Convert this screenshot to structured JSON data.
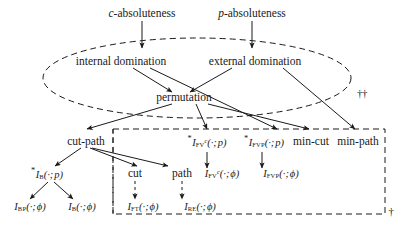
{
  "figure": {
    "type": "hierarchy-diagram",
    "background": "#ffffff",
    "stroke_color": "#1a1a1a"
  },
  "nodes": {
    "c_absoluteness": "c-absoluteness",
    "p_absoluteness": "p-absoluteness",
    "internal_domination": "internal domination",
    "external_domination": "external domination",
    "permutation": "permutation",
    "cut_path": "cut-path",
    "min_cut": "min-cut",
    "min_path": "min-path",
    "cut": "cut",
    "path": "path"
  },
  "math_nodes": {
    "i_fvc_p": {
      "star": "*",
      "sym": "I",
      "sub": "FV",
      "sup": "c",
      "arg": "(·; p)"
    },
    "i_fvp_p": {
      "star": "*",
      "sym": "I",
      "sub": "FVP",
      "sup": "",
      "arg": "(·; p)"
    },
    "i_fvc_phi": {
      "star": "",
      "sym": "I",
      "sub": "FV",
      "sup": "c",
      "arg": "(·; ϕ)"
    },
    "i_fvp_phi": {
      "star": "",
      "sym": "I",
      "sub": "FVP",
      "sup": "",
      "arg": "(·; ϕ)"
    },
    "i_b_p": {
      "star": "*",
      "sym": "I",
      "sub": "B",
      "sup": "",
      "arg": "(·; p)"
    },
    "i_bp_phi": {
      "star": "",
      "sym": "I",
      "sub": "BP",
      "sup": "",
      "arg": "(·; ϕ)"
    },
    "i_b_phi": {
      "star": "",
      "sym": "I",
      "sub": "B",
      "sup": "",
      "arg": "(·; ϕ)"
    },
    "i_ft_phi": {
      "star": "",
      "sym": "I",
      "sub": "FT",
      "sup": "",
      "arg": "(·; ϕ)"
    },
    "i_re_phi": {
      "star": "",
      "sym": "I",
      "sub": "RE",
      "sup": "",
      "arg": "(·; ϕ)"
    }
  },
  "markers": {
    "double_dagger": "††",
    "single_dagger": "†"
  }
}
